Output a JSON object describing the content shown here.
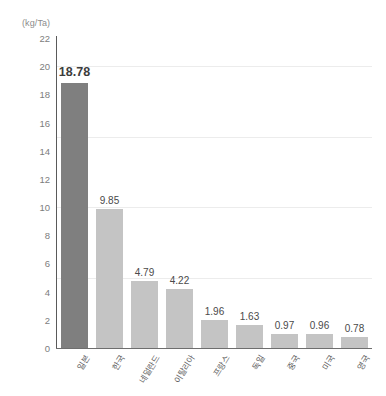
{
  "chart_data": {
    "type": "bar",
    "title": "",
    "subtitle": "",
    "xlabel": "",
    "ylabel": "",
    "unit_label": "(kg/Ta)",
    "categories": [
      "일본",
      "한국",
      "네덜란드",
      "이탈리아",
      "프랑스",
      "독일",
      "중국",
      "미국",
      "영국"
    ],
    "values": [
      18.78,
      9.85,
      4.79,
      4.22,
      1.96,
      1.63,
      0.97,
      0.96,
      0.78
    ],
    "value_labels": [
      "18.78",
      "9.85",
      "4.79",
      "4.22",
      "1.96",
      "1.63",
      "0.97",
      "0.96",
      "0.78"
    ],
    "highlight_index": 0,
    "ylim": [
      0,
      22
    ],
    "ytick_values": [
      0,
      2,
      4,
      6,
      8,
      10,
      12,
      14,
      16,
      18,
      20,
      22
    ],
    "ytick_labels": [
      "0",
      "2",
      "4",
      "6",
      "8",
      "10",
      "12",
      "14",
      "16",
      "18",
      "20",
      "22"
    ],
    "gridlines": [
      5,
      10,
      15,
      20
    ],
    "grid": true,
    "legend": "none",
    "colors": {
      "bar_default": "#c4c4c4",
      "bar_highlight": "#7f7f7f",
      "axis": "#5a5a5a",
      "grid": "#ececec",
      "tick_text": "#7d7d7d",
      "value_text": "#4a4a4a",
      "background": "#ffffff"
    }
  }
}
